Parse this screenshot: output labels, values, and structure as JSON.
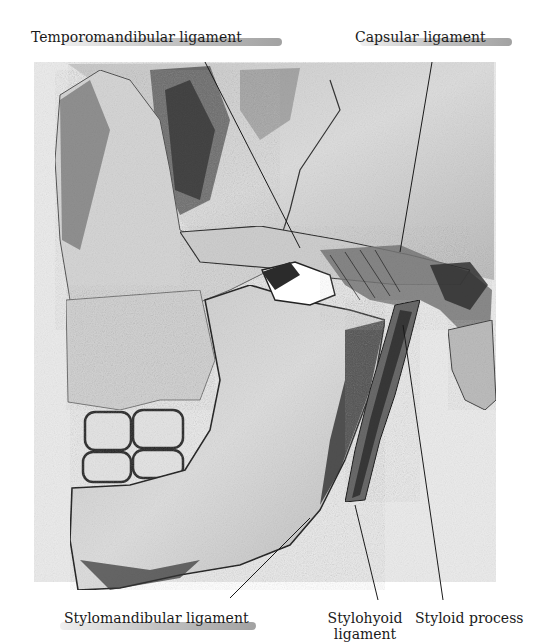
{
  "figure": {
    "colors": {
      "paper": "#f2f2f2",
      "bone": "#d9d9d9",
      "shadow": "#3a3a3a",
      "ink": "#1a1a1a"
    }
  },
  "labels": {
    "top_left": "Temporomandibular ligament",
    "top_right": "Capsular ligament",
    "bottom_left": "Stylomandibular ligament",
    "bottom_middle_line1": "Stylohyoid",
    "bottom_middle_line2": "ligament",
    "bottom_right": "Styloid process"
  }
}
